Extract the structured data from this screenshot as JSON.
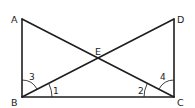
{
  "diagram": {
    "points": {
      "A": {
        "label": "A",
        "x": 22,
        "y": 19
      },
      "B": {
        "label": "B",
        "x": 22,
        "y": 97
      },
      "C": {
        "label": "C",
        "x": 174,
        "y": 97
      },
      "D": {
        "label": "D",
        "x": 174,
        "y": 19
      },
      "E": {
        "label": "E",
        "x": 98,
        "y": 58
      }
    },
    "segments": [
      "AB",
      "BC",
      "CD",
      "AC",
      "BD"
    ],
    "angles": {
      "angle1": {
        "label": "1",
        "vertex": "B",
        "between": [
          "BC",
          "BE"
        ]
      },
      "angle2": {
        "label": "2",
        "vertex": "C",
        "between": [
          "CB",
          "CE"
        ]
      },
      "angle3": {
        "label": "3",
        "vertex": "B",
        "between": [
          "BA",
          "BE"
        ]
      },
      "angle4": {
        "label": "4",
        "vertex": "C",
        "between": [
          "CD",
          "CE"
        ]
      }
    }
  }
}
